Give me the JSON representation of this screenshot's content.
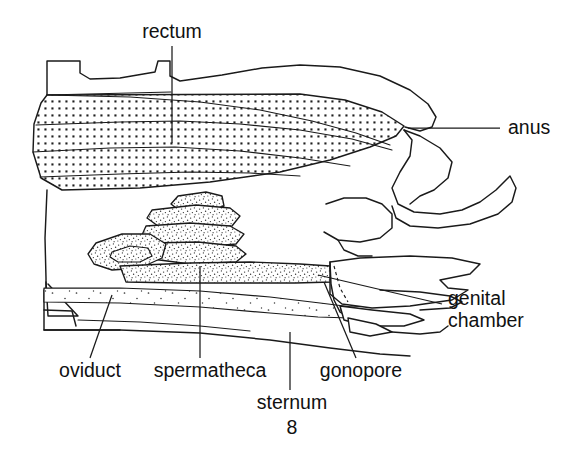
{
  "figure": {
    "background_color": "#ffffff",
    "ink_color": "#1a1a1a",
    "width": 564,
    "height": 450
  },
  "labels": {
    "rectum": {
      "text": "rectum",
      "x": 172,
      "y": 38,
      "anchor": "middle"
    },
    "anus": {
      "text": "anus",
      "x": 508,
      "y": 134,
      "anchor": "start"
    },
    "genital_line1": {
      "text": "genital",
      "x": 448,
      "y": 305,
      "anchor": "start"
    },
    "genital_line2": {
      "text": "chamber",
      "x": 448,
      "y": 327,
      "anchor": "start"
    },
    "oviduct": {
      "text": "oviduct",
      "x": 90,
      "y": 377,
      "anchor": "middle"
    },
    "spermatheca": {
      "text": "spermatheca",
      "x": 210,
      "y": 377,
      "anchor": "middle"
    },
    "gonopore": {
      "text": "gonopore",
      "x": 361,
      "y": 377,
      "anchor": "middle"
    },
    "sternum_word": {
      "text": "sternum",
      "x": 292,
      "y": 409,
      "anchor": "middle"
    },
    "sternum_number": {
      "text": "8",
      "x": 292,
      "y": 434,
      "anchor": "middle"
    }
  },
  "structures": [
    {
      "name": "rectum",
      "fill": "coarse-stipple",
      "description": "large stippled tube occupying upper abdomen, tapering to the right toward the anus"
    },
    {
      "name": "tergite-plates",
      "fill": "none",
      "description": "notched dorsal body-wall outline above the rectum"
    },
    {
      "name": "spermatheca",
      "fill": "fine-stipple",
      "description": "coiled finely stippled gland with a duct running right toward the genital chamber"
    },
    {
      "name": "oviduct",
      "fill": "sparse-stipple",
      "description": "broad faintly stippled duct along the ventral midline"
    },
    {
      "name": "genital-chamber",
      "fill": "none",
      "description": "unshaded pocket at lower right, its dorsal limit marked by a dashed line"
    },
    {
      "name": "gonopore",
      "fill": "none",
      "description": "opening where the oviduct meets the genital chamber"
    },
    {
      "name": "sternum-8",
      "fill": "none",
      "description": "ventral sclerite forming the floor of the figure"
    },
    {
      "name": "anal-lobes",
      "fill": "none",
      "description": "paired lobes flanking the anus at the right margin"
    },
    {
      "name": "apodeme",
      "fill": "none",
      "description": "small triangular internal ridge at the left margin"
    }
  ]
}
